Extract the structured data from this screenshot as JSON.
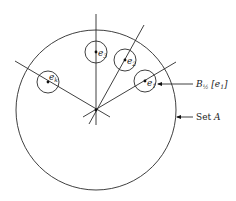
{
  "diagram": {
    "set": {
      "label_prefix": "Set ",
      "label_var": "A",
      "cx": 96,
      "cy": 110,
      "r": 80
    },
    "hub": {
      "x": 96,
      "y": 110
    },
    "points": [
      {
        "id": "e1",
        "name": "e",
        "sub": "1",
        "cx": 145,
        "cy": 81,
        "r": 11
      },
      {
        "id": "e2",
        "name": "e",
        "sub": "2",
        "cx": 125,
        "cy": 60,
        "r": 11
      },
      {
        "id": "e3",
        "name": "e",
        "sub": "3",
        "cx": 96,
        "cy": 52,
        "r": 11
      },
      {
        "id": "ek",
        "name": "e",
        "sub": "k",
        "cx": 48,
        "cy": 82,
        "r": 11
      }
    ],
    "ball_label": {
      "prefix": "B",
      "sub": "½",
      "bracket_open": " [",
      "var": "e",
      "var_sub": "1",
      "bracket_close": "]"
    }
  }
}
